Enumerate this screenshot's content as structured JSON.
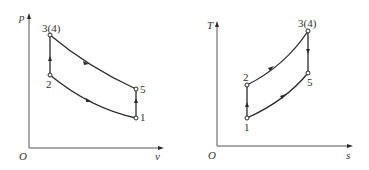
{
  "diagrams": {
    "pv": {
      "y_axis_label": "p",
      "x_axis_label": "v",
      "origin_label": "O",
      "points": {
        "p34": "3(4)",
        "p2": "2",
        "p5": "5",
        "p1": "1"
      },
      "processes": [
        {
          "from": "1",
          "to": "2",
          "type": "curve"
        },
        {
          "from": "2",
          "to": "3(4)",
          "type": "vertical"
        },
        {
          "from": "3(4)",
          "to": "5",
          "type": "curve"
        },
        {
          "from": "5",
          "to": "1",
          "type": "vertical",
          "direction": "up-arrow"
        }
      ]
    },
    "ts": {
      "y_axis_label": "T",
      "x_axis_label": "s",
      "origin_label": "O",
      "points": {
        "p34": "3(4)",
        "p2": "2",
        "p5": "5",
        "p1": "1"
      },
      "processes": [
        {
          "from": "1",
          "to": "2",
          "type": "vertical"
        },
        {
          "from": "2",
          "to": "3(4)",
          "type": "curve"
        },
        {
          "from": "3(4)",
          "to": "5",
          "type": "vertical"
        },
        {
          "from": "5",
          "to": "1",
          "type": "curve"
        }
      ]
    }
  }
}
